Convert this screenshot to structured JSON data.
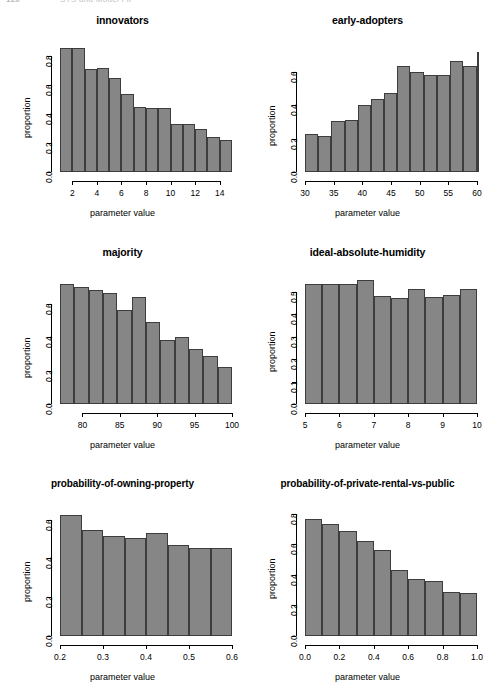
{
  "page": {
    "running_head_folio": "120",
    "running_head_title": "STS and Model Fit"
  },
  "axis_labels": {
    "x": "parameter value",
    "y": "proportion"
  },
  "colors": {
    "bar_fill": "#868686",
    "bar_border": "#3d3d3d",
    "axis": "#000000",
    "background": "#ffffff"
  },
  "chart_data": [
    {
      "type": "bar",
      "title": "innovators",
      "xlabel": "parameter value",
      "ylabel": "proportion",
      "xlim": [
        1,
        15
      ],
      "ylim": [
        0,
        0.9
      ],
      "yticks": [
        "0.0",
        "0.2",
        "0.4",
        "0.6",
        "0.8"
      ],
      "ytick_values": [
        0.0,
        0.2,
        0.4,
        0.6,
        0.8
      ],
      "xticks": [
        "2",
        "4",
        "6",
        "8",
        "10",
        "12",
        "14"
      ],
      "xtick_values": [
        2,
        4,
        6,
        8,
        10,
        12,
        14
      ],
      "bin_edges": [
        1,
        2,
        3,
        4,
        5,
        6,
        7,
        8,
        9,
        10,
        11,
        12,
        13,
        14,
        15
      ],
      "values": [
        0.86,
        0.86,
        0.71,
        0.72,
        0.65,
        0.54,
        0.45,
        0.44,
        0.44,
        0.335,
        0.33,
        0.295,
        0.245,
        0.22
      ],
      "grid": false,
      "legend": "none"
    },
    {
      "type": "bar",
      "title": "early-adopters",
      "xlabel": "parameter value",
      "ylabel": "proportion",
      "xlim": [
        30,
        60
      ],
      "ylim": [
        0,
        0.78
      ],
      "yticks": [
        "0.0",
        "0.2",
        "0.4",
        "0.6"
      ],
      "ytick_values": [
        0.0,
        0.2,
        0.4,
        0.6
      ],
      "xticks": [
        "30",
        "35",
        "40",
        "45",
        "50",
        "55",
        "60"
      ],
      "xtick_values": [
        30,
        35,
        40,
        45,
        50,
        55,
        60
      ],
      "bin_edges": [
        30,
        32.3,
        34.6,
        36.9,
        39.2,
        41.5,
        43.8,
        46.1,
        48.4,
        50.7,
        53.0,
        55.3,
        57.6,
        60
      ],
      "values": [
        0.23,
        0.215,
        0.305,
        0.31,
        0.4,
        0.44,
        0.475,
        0.635,
        0.6,
        0.585,
        0.585,
        0.665,
        0.635,
        0.72
      ],
      "grid": false,
      "legend": "none"
    },
    {
      "type": "bar",
      "title": "majority",
      "xlabel": "parameter value",
      "ylabel": "proportion",
      "xlim": [
        77,
        100
      ],
      "ylim": [
        0,
        0.78
      ],
      "yticks": [
        "0.0",
        "0.2",
        "0.4",
        "0.6"
      ],
      "ytick_values": [
        0.0,
        0.2,
        0.4,
        0.6
      ],
      "xticks": [
        "80",
        "85",
        "90",
        "95",
        "100"
      ],
      "xtick_values": [
        80,
        85,
        90,
        95,
        100
      ],
      "bin_edges": [
        77,
        78.92,
        80.83,
        82.75,
        84.67,
        86.58,
        88.5,
        90.42,
        92.33,
        94.25,
        96.17,
        98.08,
        100
      ],
      "values": [
        0.72,
        0.705,
        0.685,
        0.665,
        0.565,
        0.645,
        0.49,
        0.385,
        0.405,
        0.33,
        0.29,
        0.22
      ],
      "grid": false,
      "legend": "none"
    },
    {
      "type": "bar",
      "title": "ideal-absolute-humidity",
      "xlabel": "parameter value",
      "ylabel": "proportion",
      "xlim": [
        5,
        10
      ],
      "ylim": [
        0,
        0.58
      ],
      "yticks": [
        "0.0",
        "0.1",
        "0.2",
        "0.3",
        "0.4",
        "0.5"
      ],
      "ytick_values": [
        0.0,
        0.1,
        0.2,
        0.3,
        0.4,
        0.5
      ],
      "xticks": [
        "5",
        "6",
        "7",
        "8",
        "9",
        "10"
      ],
      "xtick_values": [
        5,
        6,
        7,
        8,
        9,
        10
      ],
      "bin_edges": [
        5,
        5.5,
        6.0,
        6.5,
        7.0,
        7.5,
        8.0,
        8.5,
        9.0,
        9.5,
        10
      ],
      "values": [
        0.535,
        0.535,
        0.535,
        0.555,
        0.48,
        0.475,
        0.515,
        0.477,
        0.487,
        0.515
      ],
      "grid": false,
      "legend": "none"
    },
    {
      "type": "bar",
      "title": "probability-of-owning-property",
      "xlabel": "parameter value",
      "ylabel": "proportion",
      "xlim": [
        0.2,
        0.6
      ],
      "ylim": [
        0,
        0.67
      ],
      "yticks": [
        "0.0",
        "0.2",
        "0.4",
        "0.6"
      ],
      "ytick_values": [
        0.0,
        0.2,
        0.4,
        0.6
      ],
      "xticks": [
        "0.2",
        "0.3",
        "0.4",
        "0.5",
        "0.6"
      ],
      "xtick_values": [
        0.2,
        0.3,
        0.4,
        0.5,
        0.6
      ],
      "bin_edges": [
        0.2,
        0.25,
        0.3,
        0.35,
        0.4,
        0.45,
        0.5,
        0.55,
        0.6
      ],
      "values": [
        0.625,
        0.545,
        0.515,
        0.505,
        0.53,
        0.47,
        0.455,
        0.455
      ],
      "grid": false,
      "legend": "none"
    },
    {
      "type": "bar",
      "title": "probability-of-private-rental-vs-public",
      "xlabel": "parameter value",
      "ylabel": "proportion",
      "xlim": [
        0.0,
        1.0
      ],
      "ylim": [
        0,
        0.85
      ],
      "yticks": [
        "0.0",
        "0.2",
        "0.4",
        "0.6",
        "0.8"
      ],
      "ytick_values": [
        0.0,
        0.2,
        0.4,
        0.6,
        0.8
      ],
      "xticks": [
        "0.0",
        "0.2",
        "0.4",
        "0.6",
        "0.8",
        "1.0"
      ],
      "xtick_values": [
        0.0,
        0.2,
        0.4,
        0.6,
        0.8,
        1.0
      ],
      "bin_edges": [
        0.0,
        0.1,
        0.2,
        0.3,
        0.4,
        0.5,
        0.6,
        0.7,
        0.8,
        0.9,
        1.0
      ],
      "values": [
        0.765,
        0.735,
        0.685,
        0.62,
        0.565,
        0.43,
        0.375,
        0.36,
        0.29,
        0.28
      ],
      "grid": false,
      "legend": "none"
    }
  ]
}
